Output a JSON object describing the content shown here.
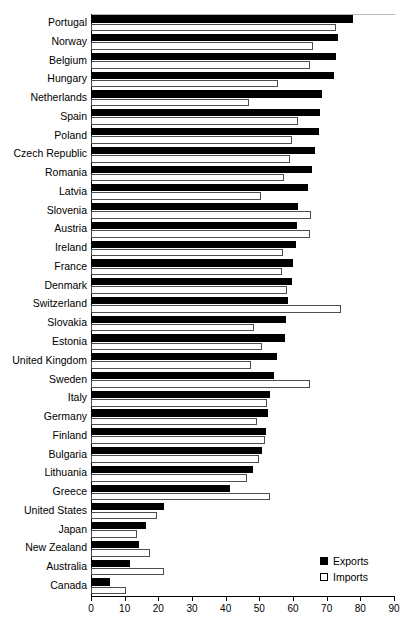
{
  "chart_data": {
    "type": "bar",
    "orientation": "horizontal",
    "title": "",
    "xlabel": "",
    "ylabel": "",
    "xlim": [
      0,
      90
    ],
    "xticks": [
      0,
      10,
      20,
      30,
      40,
      50,
      60,
      70,
      80,
      90
    ],
    "grid": false,
    "legend_position": "bottom-right",
    "categories": [
      "Portugal",
      "Norway",
      "Belgium",
      "Hungary",
      "Netherlands",
      "Spain",
      "Poland",
      "Czech Republic",
      "Romania",
      "Latvia",
      "Slovenia",
      "Austria",
      "Ireland",
      "France",
      "Denmark",
      "Switzerland",
      "Slovakia",
      "Estonia",
      "United Kingdom",
      "Sweden",
      "Italy",
      "Germany",
      "Finland",
      "Bulgaria",
      "Lithuania",
      "Greece",
      "United States",
      "Japan",
      "New Zealand",
      "Australia",
      "Canada"
    ],
    "series": [
      {
        "name": "Exports",
        "color": "#000000",
        "values": [
          77.7,
          73.5,
          72.9,
          72.3,
          68.5,
          68.1,
          67.6,
          66.5,
          65.6,
          64.6,
          61.6,
          61.2,
          60.9,
          60.0,
          59.6,
          58.4,
          57.8,
          57.5,
          55.2,
          54.5,
          53.2,
          52.6,
          51.9,
          50.7,
          48.2,
          41.3,
          21.8,
          16.2,
          14.4,
          11.6,
          5.6
        ]
      },
      {
        "name": "Imports",
        "color": "#ffffff",
        "values": [
          72.8,
          65.9,
          65.1,
          55.5,
          46.8,
          61.5,
          59.6,
          59.2,
          57.3,
          50.5,
          65.4,
          65.1,
          56.9,
          56.6,
          58.2,
          74.3,
          48.4,
          50.8,
          47.4,
          65.1,
          52.4,
          49.4,
          51.6,
          49.8,
          46.4,
          53.2,
          19.7,
          13.8,
          17.6,
          21.7,
          10.3
        ]
      }
    ],
    "legend": [
      {
        "label": "Exports",
        "swatch": "filled-square"
      },
      {
        "label": "Imports",
        "swatch": "outlined-square"
      }
    ]
  }
}
